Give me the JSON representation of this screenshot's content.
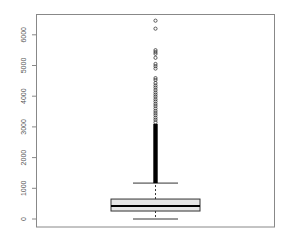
{
  "chart_data": {
    "type": "boxplot",
    "title": "",
    "xlabel": "",
    "ylabel": "",
    "ylim": [
      -250,
      6750
    ],
    "yticks": [
      0,
      1000,
      2000,
      3000,
      4000,
      5000,
      6000
    ],
    "ytick_labels": [
      "0",
      "1000",
      "2000",
      "3000",
      "4000",
      "5000",
      "6000"
    ],
    "grid": false,
    "legend": null,
    "box": {
      "lower_whisker": 0,
      "q1": 260,
      "median": 420,
      "q3": 650,
      "upper_whisker": 1170
    },
    "outliers": [
      6460,
      6200,
      5500,
      5440,
      5380,
      5250,
      5050,
      4980,
      4900,
      4590,
      4530,
      4430,
      4350,
      4280,
      4200,
      4120,
      4050,
      3980,
      3900,
      3830,
      3750,
      3680,
      3600,
      3520,
      3450,
      3380,
      3300,
      3230,
      3150
    ],
    "dense_outlier_range": [
      1170,
      3100
    ],
    "colors": {
      "box_fill": "#e6e6e6",
      "box_stroke": "#000000",
      "frame": "#888888",
      "outlier": "#000000"
    }
  }
}
